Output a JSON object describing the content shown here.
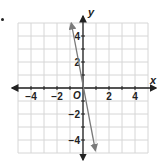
{
  "chart_data": {
    "type": "line",
    "title": "",
    "xlabel": "x",
    "ylabel": "y",
    "origin_label": "O",
    "xlim": [
      -5,
      5
    ],
    "ylim": [
      -5,
      5
    ],
    "grid": true,
    "grid_step": 1,
    "x_ticks": [
      -4,
      -2,
      2,
      4
    ],
    "y_ticks": [
      4,
      2,
      -2,
      -4
    ],
    "x_tick_labels": [
      "−4",
      "−2",
      "2",
      "4"
    ],
    "y_tick_labels": [
      "4",
      "2",
      "−2",
      "−4"
    ],
    "series": [
      {
        "name": "line",
        "x": [
          -0.9,
          0.95
        ],
        "y": [
          5.0,
          -4.8
        ],
        "color": "#7a7a7a",
        "arrows_both_ends": true
      }
    ]
  },
  "colors": {
    "grid": "#d6d6d6",
    "axis": "#222222",
    "line": "#7a7a7a",
    "text": "#222222"
  }
}
